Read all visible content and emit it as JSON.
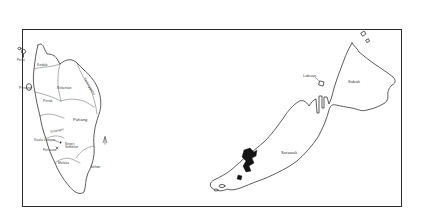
{
  "figure": {
    "type": "map",
    "region_left": "Peninsular Malaysia",
    "region_right": "East Malaysia (Borneo)"
  },
  "colors": {
    "frame": "#2a2a2a",
    "coastline": "#4a4a4a",
    "state_border": "#6a6a6a",
    "label": "#3b3b3b",
    "highlight": "#141414",
    "background": "#ffffff"
  },
  "labels": {
    "perlis": "Perlis",
    "kedah": "Kedah",
    "penang": "Penang",
    "kelantan": "Kelantan",
    "terengganu": "Terengganu",
    "perak": "Perak",
    "pahang": "Pahang",
    "selangor": "Selangor",
    "kuala_lumpur": "Kuala Lumpur",
    "putrajaya": "Putrajaya",
    "negeri_sembilan": "Negeri Sembilan",
    "melaka": "Melaka",
    "johor": "Johor",
    "labuan": "Labuan",
    "sabah": "Sabah",
    "sarawak": "Sarawak"
  }
}
